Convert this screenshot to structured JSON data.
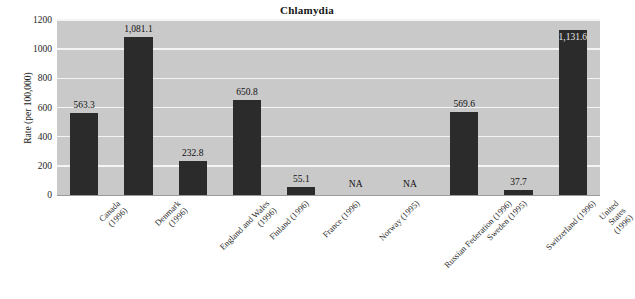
{
  "chart_data": {
    "type": "bar",
    "title": "Chlamydia",
    "xlabel": "",
    "ylabel": "Rate (per 100,000)",
    "ylim": [
      0,
      1200
    ],
    "ytick_values": [
      0,
      200,
      400,
      600,
      800,
      1000,
      1200
    ],
    "ytick_labels": [
      "0",
      "200",
      "400",
      "600",
      "800",
      "1000",
      "1200"
    ],
    "grid": true,
    "legend": "none",
    "plot_background": "#c9c9c9",
    "bar_color": "#2b2b2b",
    "gridline_color": "#f4f4f4",
    "categories": [
      "Canada\n(1996)",
      "Denmark\n(1996)",
      "England and Wales\n(1996)",
      "Finland (1996)",
      "France (1996)",
      "Norway (1995)",
      "Russian Federation (1996)",
      "Sweden (1995)",
      "Switzerland (1996)",
      "United States (1996)"
    ],
    "values": [
      563.3,
      1081.1,
      232.8,
      650.8,
      55.1,
      null,
      null,
      569.6,
      37.7,
      1131.6
    ],
    "value_labels": [
      "563.3",
      "1,081.1",
      "232.8",
      "650.8",
      "55.1",
      "NA",
      "NA",
      "569.6",
      "37.7",
      "1,131.6"
    ],
    "missing_label": "NA"
  }
}
